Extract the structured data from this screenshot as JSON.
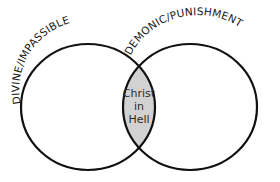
{
  "diagram": {
    "type": "venn",
    "sets": [
      {
        "id": "left",
        "label": "DIVINE/IMPASSIBLE"
      },
      {
        "id": "right",
        "label": "DEMONIC/PUNISHMENT"
      }
    ],
    "intersection": {
      "line1": "Christ",
      "line2": "in",
      "line3": "Hell"
    },
    "colors": {
      "stroke": "#111111",
      "intersection_fill": "#d2d2d2",
      "background": "#ffffff"
    }
  }
}
